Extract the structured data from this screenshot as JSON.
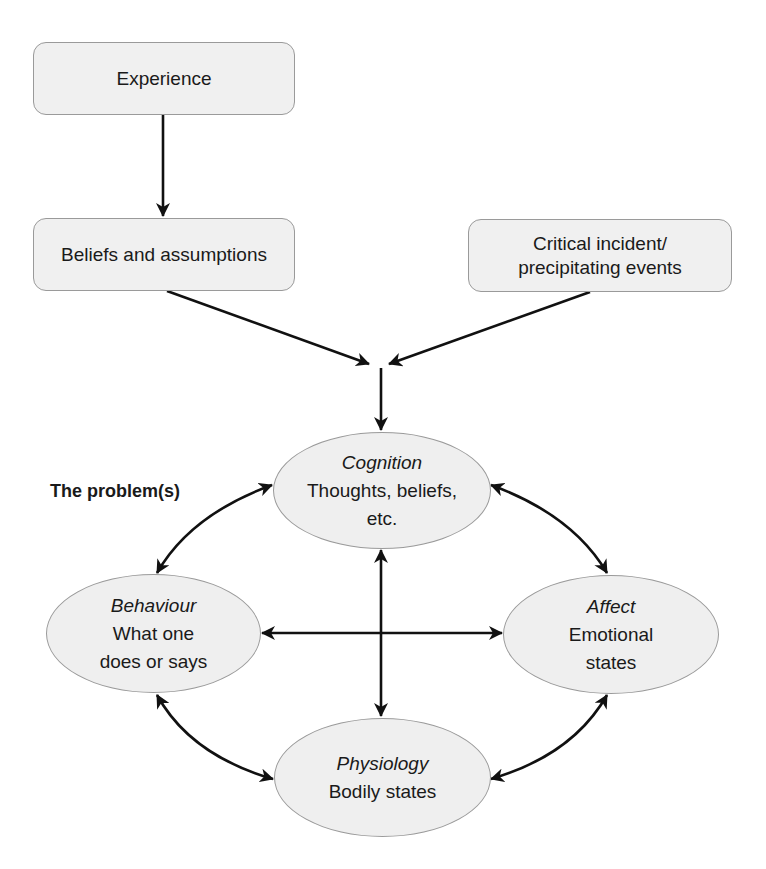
{
  "diagram": {
    "boxes": {
      "experience": "Experience",
      "beliefs": "Beliefs and assumptions",
      "critical_line1": "Critical incident/",
      "critical_line2": "precipitating events"
    },
    "problem_label": "The problem(s)",
    "nodes": {
      "cognition": {
        "title": "Cognition",
        "line1": "Thoughts, beliefs,",
        "line2": "etc."
      },
      "behaviour": {
        "title": "Behaviour",
        "line1": "What one",
        "line2": "does or says"
      },
      "affect": {
        "title": "Affect",
        "line1": "Emotional",
        "line2": "states"
      },
      "physiology": {
        "title": "Physiology",
        "line1": "Bodily states"
      }
    },
    "edges": [
      {
        "from": "Experience",
        "to": "Beliefs and assumptions",
        "type": "single"
      },
      {
        "from": "Beliefs and assumptions",
        "to": "Cognition",
        "type": "single"
      },
      {
        "from": "Critical incident/precipitating events",
        "to": "Cognition",
        "type": "single"
      },
      {
        "from": "Cognition",
        "to": "Behaviour",
        "type": "double"
      },
      {
        "from": "Cognition",
        "to": "Affect",
        "type": "double"
      },
      {
        "from": "Cognition",
        "to": "Physiology",
        "type": "double"
      },
      {
        "from": "Behaviour",
        "to": "Affect",
        "type": "double"
      },
      {
        "from": "Behaviour",
        "to": "Physiology",
        "type": "double"
      },
      {
        "from": "Affect",
        "to": "Physiology",
        "type": "double"
      }
    ],
    "colors": {
      "fill": "#efefef",
      "border": "#9a9a9a",
      "arrow": "#111111"
    }
  }
}
